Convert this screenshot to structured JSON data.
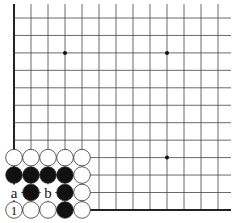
{
  "diagram": {
    "type": "go-board-fragment",
    "corner": "bottom-left",
    "grid": {
      "origin_x": 14,
      "origin_y": 18,
      "spacing_x": 17.0,
      "spacing_y": 17.45,
      "cols": 13,
      "rows": 12,
      "open_right": true,
      "open_top": true
    },
    "colors": {
      "line": "#444444",
      "edge": "#222222",
      "black_stone": "#111111",
      "white_stone": "#ffffff",
      "stone_outline": "#333333",
      "background": "#ffffff"
    },
    "star_points": [
      {
        "col": 3,
        "row": 2
      },
      {
        "col": 9,
        "row": 2
      },
      {
        "col": 9,
        "row": 8
      }
    ],
    "stones": [
      {
        "col": 0,
        "row": 8,
        "color": "white"
      },
      {
        "col": 1,
        "row": 8,
        "color": "white"
      },
      {
        "col": 2,
        "row": 8,
        "color": "white"
      },
      {
        "col": 3,
        "row": 8,
        "color": "white"
      },
      {
        "col": 4,
        "row": 8,
        "color": "white"
      },
      {
        "col": 0,
        "row": 9,
        "color": "black"
      },
      {
        "col": 1,
        "row": 9,
        "color": "black"
      },
      {
        "col": 2,
        "row": 9,
        "color": "black"
      },
      {
        "col": 3,
        "row": 9,
        "color": "black"
      },
      {
        "col": 4,
        "row": 9,
        "color": "white"
      },
      {
        "col": 1,
        "row": 10,
        "color": "black"
      },
      {
        "col": 3,
        "row": 10,
        "color": "black"
      },
      {
        "col": 4,
        "row": 10,
        "color": "white"
      },
      {
        "col": 0,
        "row": 11,
        "color": "white",
        "label": "1"
      },
      {
        "col": 1,
        "row": 11,
        "color": "white"
      },
      {
        "col": 2,
        "row": 11,
        "color": "white"
      },
      {
        "col": 3,
        "row": 11,
        "color": "black"
      },
      {
        "col": 4,
        "row": 11,
        "color": "white"
      }
    ],
    "point_labels": [
      {
        "col": 0,
        "row": 10,
        "text": "a"
      },
      {
        "col": 2,
        "row": 10,
        "text": "b"
      }
    ]
  }
}
